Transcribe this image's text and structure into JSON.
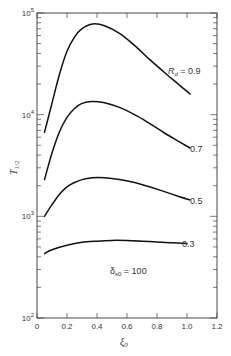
{
  "chart_data": {
    "type": "line",
    "title": "",
    "xlabel": "ξ0",
    "ylabel": "T1/2",
    "xlim": [
      0,
      1.2
    ],
    "ylim": [
      100,
      100000
    ],
    "yscale": "log",
    "grid": false,
    "x_ticks": [
      "0",
      "0.2",
      "0.4",
      "0.6",
      "0.8",
      "1.0",
      "1.2"
    ],
    "y_ticks": [
      "10^2",
      "10^3",
      "10^4",
      "10^5"
    ],
    "annotation": "δs0 = 100",
    "legend_title": "Rd",
    "series": [
      {
        "name": "Rd = 0.9",
        "label": "0.9",
        "x": [
          0.05,
          0.1,
          0.15,
          0.2,
          0.25,
          0.3,
          0.37,
          0.45,
          0.55,
          0.65,
          0.75,
          0.85,
          0.95,
          1.02
        ],
        "y": [
          6700,
          13000,
          25000,
          42000,
          58000,
          70000,
          78000,
          75000,
          63000,
          48000,
          35000,
          26000,
          19500,
          16000
        ]
      },
      {
        "name": "Rd = 0.7",
        "label": "0.7",
        "x": [
          0.05,
          0.1,
          0.15,
          0.2,
          0.25,
          0.3,
          0.37,
          0.45,
          0.55,
          0.65,
          0.75,
          0.85,
          0.95,
          1.02
        ],
        "y": [
          2300,
          4200,
          6800,
          9400,
          11500,
          12900,
          13500,
          13100,
          11800,
          10000,
          8200,
          6600,
          5400,
          4700
        ]
      },
      {
        "name": "Rd = 0.5",
        "label": "0.5",
        "x": [
          0.05,
          0.1,
          0.15,
          0.2,
          0.25,
          0.3,
          0.37,
          0.45,
          0.55,
          0.65,
          0.75,
          0.85,
          0.95,
          1.02
        ],
        "y": [
          1000,
          1300,
          1650,
          1950,
          2150,
          2300,
          2400,
          2400,
          2300,
          2150,
          1950,
          1750,
          1560,
          1450
        ]
      },
      {
        "name": "Rd = 0.3",
        "label": "0.3",
        "x": [
          0.05,
          0.1,
          0.2,
          0.3,
          0.4,
          0.5,
          0.6,
          0.7,
          0.8,
          0.9,
          1.0
        ],
        "y": [
          430,
          470,
          520,
          555,
          570,
          580,
          578,
          570,
          560,
          550,
          540
        ]
      }
    ]
  },
  "labels": {
    "y_axis": {
      "main": "T",
      "sub": "1/2"
    },
    "x_axis": {
      "main": "ξ",
      "sub": "0"
    },
    "annotation": {
      "main": "δ",
      "sub": "s0",
      "rest": " = 100"
    },
    "rd_prefix": {
      "main": "R",
      "sub": "d",
      "rest": " = 0.9"
    },
    "curve_07": "0.7",
    "curve_05": "0.5",
    "curve_03": "0.3"
  }
}
